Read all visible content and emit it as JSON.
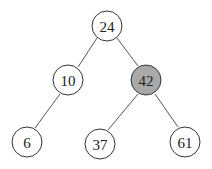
{
  "diagram": {
    "type": "binary-tree",
    "highlight_color": "#a9a9a9",
    "node_fill": "#ffffff",
    "nodes": [
      {
        "id": "n24",
        "label": "24",
        "x": 107,
        "y": 26,
        "highlighted": false
      },
      {
        "id": "n10",
        "label": "10",
        "x": 68,
        "y": 80,
        "highlighted": false
      },
      {
        "id": "n42",
        "label": "42",
        "x": 146,
        "y": 80,
        "highlighted": true
      },
      {
        "id": "n6",
        "label": "6",
        "x": 27,
        "y": 142,
        "highlighted": false
      },
      {
        "id": "n37",
        "label": "37",
        "x": 100,
        "y": 144,
        "highlighted": false
      },
      {
        "id": "n61",
        "label": "61",
        "x": 185,
        "y": 142,
        "highlighted": false
      }
    ],
    "edges": [
      {
        "from": "24",
        "to": "10"
      },
      {
        "from": "24",
        "to": "42"
      },
      {
        "from": "10",
        "to": "6"
      },
      {
        "from": "42",
        "to": "37"
      },
      {
        "from": "42",
        "to": "61"
      }
    ]
  }
}
